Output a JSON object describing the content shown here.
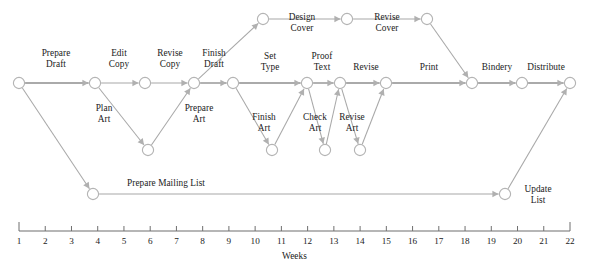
{
  "diagram": {
    "type": "pert-network",
    "colors": {
      "edge": "#a8a8a8",
      "edge_strong": "#8e8e8e",
      "arrow": "#b0b0b0",
      "node_stroke": "#b4b4b4",
      "node_fill": "#ffffff",
      "axis": "#6f6f6f",
      "text": "#1b1b1b",
      "background": "#ffffff"
    },
    "nodes": [
      {
        "id": "n_start",
        "x": 19,
        "y": 83,
        "r": 5.6
      },
      {
        "id": "n_editcopy",
        "x": 95,
        "y": 83,
        "r": 5.6
      },
      {
        "id": "n_revisecopy",
        "x": 145,
        "y": 83,
        "r": 5.6
      },
      {
        "id": "n_finishdraft",
        "x": 194,
        "y": 83,
        "r": 5.6
      },
      {
        "id": "n_settype",
        "x": 233,
        "y": 83,
        "r": 5.6
      },
      {
        "id": "n_prooftext",
        "x": 307,
        "y": 83,
        "r": 5.6
      },
      {
        "id": "n_revise",
        "x": 340,
        "y": 83,
        "r": 5.6
      },
      {
        "id": "n_print",
        "x": 386,
        "y": 83,
        "r": 5.6
      },
      {
        "id": "n_bindery",
        "x": 472,
        "y": 83,
        "r": 5.6
      },
      {
        "id": "n_distribute",
        "x": 522,
        "y": 83,
        "r": 5.6
      },
      {
        "id": "n_end",
        "x": 570,
        "y": 83,
        "r": 5.6
      },
      {
        "id": "n_planart",
        "x": 148,
        "y": 150,
        "r": 5.6
      },
      {
        "id": "n_prepart",
        "x": 272,
        "y": 150,
        "r": 5.6
      },
      {
        "id": "n_checkart",
        "x": 325,
        "y": 150,
        "r": 5.6
      },
      {
        "id": "n_reviseart",
        "x": 360,
        "y": 150,
        "r": 5.6
      },
      {
        "id": "n_designcover",
        "x": 263,
        "y": 19,
        "r": 5.6
      },
      {
        "id": "n_revisecover",
        "x": 347,
        "y": 19,
        "r": 5.6
      },
      {
        "id": "n_covertop",
        "x": 427,
        "y": 19,
        "r": 5.6
      },
      {
        "id": "n_mailing",
        "x": 93,
        "y": 194,
        "r": 5.6
      },
      {
        "id": "n_update",
        "x": 505,
        "y": 194,
        "r": 5.6
      }
    ],
    "edges": [
      {
        "from": "n_start",
        "to": "n_editcopy",
        "strong": true,
        "label": "Prepare Draft"
      },
      {
        "from": "n_editcopy",
        "to": "n_revisecopy",
        "strong": false,
        "label": "Edit Copy"
      },
      {
        "from": "n_revisecopy",
        "to": "n_finishdraft",
        "strong": false,
        "label": "Revise Copy"
      },
      {
        "from": "n_finishdraft",
        "to": "n_settype",
        "strong": true,
        "label": "Finish Draft"
      },
      {
        "from": "n_settype",
        "to": "n_prooftext",
        "strong": true,
        "label": "Set Type"
      },
      {
        "from": "n_prooftext",
        "to": "n_revise",
        "strong": true,
        "label": "Proof Text"
      },
      {
        "from": "n_revise",
        "to": "n_print",
        "strong": true,
        "label": "Revise"
      },
      {
        "from": "n_print",
        "to": "n_bindery",
        "strong": true,
        "label": "Print"
      },
      {
        "from": "n_bindery",
        "to": "n_distribute",
        "strong": true,
        "label": "Bindery"
      },
      {
        "from": "n_distribute",
        "to": "n_end",
        "strong": true,
        "label": "Distribute"
      },
      {
        "from": "n_editcopy",
        "to": "n_planart",
        "strong": false,
        "label": "Plan Art"
      },
      {
        "from": "n_planart",
        "to": "n_finishdraft",
        "strong": false,
        "label": "Prepare Art"
      },
      {
        "from": "n_settype",
        "to": "n_prepart",
        "strong": false,
        "label": "Finish Art"
      },
      {
        "from": "n_prepart",
        "to": "n_prooftext",
        "strong": false,
        "label": "Check Art"
      },
      {
        "from": "n_checkart",
        "to": "n_revise",
        "strong": false,
        "label": "Revise Art"
      },
      {
        "from": "n_prooftext",
        "to": "n_checkart",
        "strong": false,
        "label": ""
      },
      {
        "from": "n_revise",
        "to": "n_reviseart",
        "strong": false,
        "label": ""
      },
      {
        "from": "n_reviseart",
        "to": "n_print",
        "strong": false,
        "label": ""
      },
      {
        "from": "n_finishdraft",
        "to": "n_designcover",
        "strong": false,
        "label": ""
      },
      {
        "from": "n_designcover",
        "to": "n_revisecover",
        "strong": false,
        "label": "Design Cover"
      },
      {
        "from": "n_revisecover",
        "to": "n_covertop",
        "strong": false,
        "label": "Revise Cover"
      },
      {
        "from": "n_covertop",
        "to": "n_bindery",
        "strong": false,
        "label": ""
      },
      {
        "from": "n_start",
        "to": "n_mailing",
        "strong": false,
        "label": ""
      },
      {
        "from": "n_mailing",
        "to": "n_update",
        "strong": false,
        "label": "Prepare Mailing List"
      },
      {
        "from": "n_update",
        "to": "n_end",
        "strong": false,
        "label": "Update List"
      }
    ],
    "labels": [
      {
        "id": "lbl_prepare_draft",
        "text": "Prepare\nDraft",
        "x": 56,
        "y": 48,
        "w": 56,
        "lines": 2
      },
      {
        "id": "lbl_edit_copy",
        "text": "Edit\nCopy",
        "x": 119,
        "y": 48,
        "w": 46,
        "lines": 2
      },
      {
        "id": "lbl_revise_copy",
        "text": "Revise\nCopy",
        "x": 170,
        "y": 48,
        "w": 52,
        "lines": 2
      },
      {
        "id": "lbl_finish_draft",
        "text": "Finish\nDraft",
        "x": 214,
        "y": 48,
        "w": 52,
        "lines": 2
      },
      {
        "id": "lbl_set_type",
        "text": "Set\nType",
        "x": 270,
        "y": 51,
        "w": 42,
        "lines": 2
      },
      {
        "id": "lbl_proof_text",
        "text": "Proof\nText",
        "x": 322,
        "y": 51,
        "w": 44,
        "lines": 2
      },
      {
        "id": "lbl_revise",
        "text": "Revise",
        "x": 366,
        "y": 62,
        "w": 46,
        "lines": 1
      },
      {
        "id": "lbl_print",
        "text": "Print",
        "x": 429,
        "y": 62,
        "w": 40,
        "lines": 1
      },
      {
        "id": "lbl_bindery",
        "text": "Bindery",
        "x": 497,
        "y": 62,
        "w": 50,
        "lines": 1
      },
      {
        "id": "lbl_distribute",
        "text": "Distribute",
        "x": 546,
        "y": 62,
        "w": 58,
        "lines": 1
      },
      {
        "id": "lbl_plan_art",
        "text": "Plan\nArt",
        "x": 104,
        "y": 103,
        "w": 40,
        "lines": 2
      },
      {
        "id": "lbl_prepare_art",
        "text": "Prepare\nArt",
        "x": 199,
        "y": 103,
        "w": 54,
        "lines": 2
      },
      {
        "id": "lbl_finish_art",
        "text": "Finish\nArt",
        "x": 264,
        "y": 112,
        "w": 44,
        "lines": 2
      },
      {
        "id": "lbl_check_art",
        "text": "Check\nArt",
        "x": 315,
        "y": 112,
        "w": 44,
        "lines": 2
      },
      {
        "id": "lbl_revise_art",
        "text": "Revise\nArt",
        "x": 352,
        "y": 112,
        "w": 46,
        "lines": 2
      },
      {
        "id": "lbl_design_cover",
        "text": "Design\nCover",
        "x": 302,
        "y": 12,
        "w": 52,
        "lines": 2
      },
      {
        "id": "lbl_revise_cover",
        "text": "Revise\nCover",
        "x": 387,
        "y": 12,
        "w": 52,
        "lines": 2
      },
      {
        "id": "lbl_mailing_list",
        "text": "Prepare Mailing List",
        "x": 166,
        "y": 178,
        "w": 120,
        "lines": 1
      },
      {
        "id": "lbl_update_list",
        "text": "Update\nList",
        "x": 538,
        "y": 184,
        "w": 50,
        "lines": 2
      }
    ]
  },
  "axis": {
    "label": "Weeks",
    "start_x": 19,
    "end_x": 570,
    "y": 231,
    "ticks": [
      "1",
      "2",
      "3",
      "4",
      "5",
      "6",
      "7",
      "8",
      "9",
      "10",
      "11",
      "12",
      "13",
      "14",
      "15",
      "16",
      "17",
      "18",
      "19",
      "20",
      "21",
      "22"
    ]
  }
}
